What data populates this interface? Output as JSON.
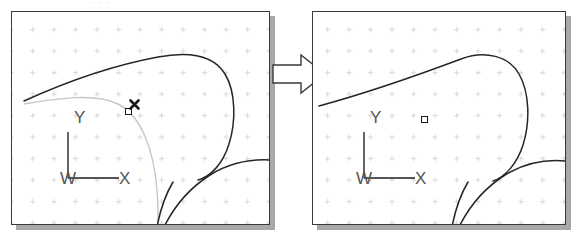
{
  "figure": {
    "type": "cad-before-after-illustration",
    "background": "#ffffff",
    "width": 577,
    "height": 247,
    "top_clipped_text": "· · ·"
  },
  "colors": {
    "panel_border": "#3a3a3a",
    "panel_shadow": "#a8a8a8",
    "panel_fill": "#ffffff",
    "grid_dot": "#d2d2d2",
    "geometry_stroke": "#262626",
    "ghost_arc_stroke": "#c6c6c6",
    "marker_stroke": "#1a1a1a",
    "ucs_stroke": "#555555",
    "arrow_fill": "#ffffff",
    "arrow_stroke": "#3a3a3a"
  },
  "panels": [
    {
      "id": "before",
      "name": "before-viewport",
      "label": "Before",
      "x": 11,
      "y": 11,
      "width": 259,
      "height": 214,
      "shadow_offset": 5,
      "grid": {
        "spacing_x": 21.5,
        "spacing_y": 21.5,
        "origin_x": 18,
        "origin_y": 15,
        "dot_style": "cross"
      },
      "ucs_icon": {
        "name": "wcs-axis-icon",
        "origin_label": "W",
        "y_label": "Y",
        "x_label": "X",
        "x": 45,
        "y": 108,
        "arm_length": 58
      },
      "markers": [
        {
          "name": "grip-square",
          "kind": "grip",
          "x": 117,
          "y": 100
        },
        {
          "name": "snap-x-marker",
          "kind": "snap-x",
          "x": 122,
          "y": 92
        }
      ],
      "geometry": [
        {
          "name": "upper-dark-edge",
          "kind": "stroke",
          "style": "solid-dark",
          "width": 1.5,
          "d": "M 12 89 C 45 74, 92 55, 146 45 C 178 39, 202 44, 213 62 C 224 80, 224 110, 217 132 C 211 152, 198 165, 186 168"
        },
        {
          "name": "lower-right-arc",
          "kind": "stroke",
          "style": "solid-dark",
          "width": 1.5,
          "d": "M 258 148 C 238 147, 216 152, 198 163 C 176 177, 158 199, 147 226"
        },
        {
          "name": "lower-left-tail",
          "kind": "stroke",
          "style": "solid-dark",
          "width": 1.5,
          "d": "M 143 226 C 146 206, 152 185, 161 170"
        },
        {
          "name": "ghost-preview-arc",
          "kind": "stroke",
          "style": "light-gray",
          "width": 1.4,
          "d": "M 12 92 C 48 86, 84 81, 106 92 C 130 104, 142 140, 145 178 C 147 202, 146 216, 144 226"
        }
      ]
    },
    {
      "id": "after",
      "name": "after-viewport",
      "label": "After",
      "x": 312,
      "y": 11,
      "width": 254,
      "height": 214,
      "shadow_offset": 5,
      "grid": {
        "spacing_x": 21.5,
        "spacing_y": 21.5,
        "origin_x": 12,
        "origin_y": 15,
        "dot_style": "cross"
      },
      "ucs_icon": {
        "name": "wcs-axis-icon",
        "origin_label": "W",
        "y_label": "Y",
        "x_label": "X",
        "x": 40,
        "y": 108,
        "arm_length": 58
      },
      "markers": [
        {
          "name": "grip-square",
          "kind": "grip",
          "x": 112,
          "y": 108
        }
      ],
      "geometry": [
        {
          "name": "upper-dark-edge",
          "kind": "stroke",
          "style": "solid-dark",
          "width": 1.5,
          "d": "M 6 94 C 50 82, 108 62, 148 47 C 172 38, 196 44, 206 62 C 217 81, 217 111, 210 133 C 204 152, 192 165, 180 169"
        },
        {
          "name": "lower-right-arc",
          "kind": "stroke",
          "style": "solid-dark",
          "width": 1.5,
          "d": "M 253 149 C 232 147, 210 152, 192 163 C 170 177, 152 199, 141 226"
        },
        {
          "name": "lower-left-tail",
          "kind": "stroke",
          "style": "solid-dark",
          "width": 1.5,
          "d": "M 137 226 C 140 206, 146 185, 155 170"
        }
      ]
    }
  ],
  "arrow": {
    "name": "transition-arrow",
    "label": "",
    "direction": "right",
    "x": 271,
    "y": 53,
    "width": 55,
    "height": 40
  }
}
